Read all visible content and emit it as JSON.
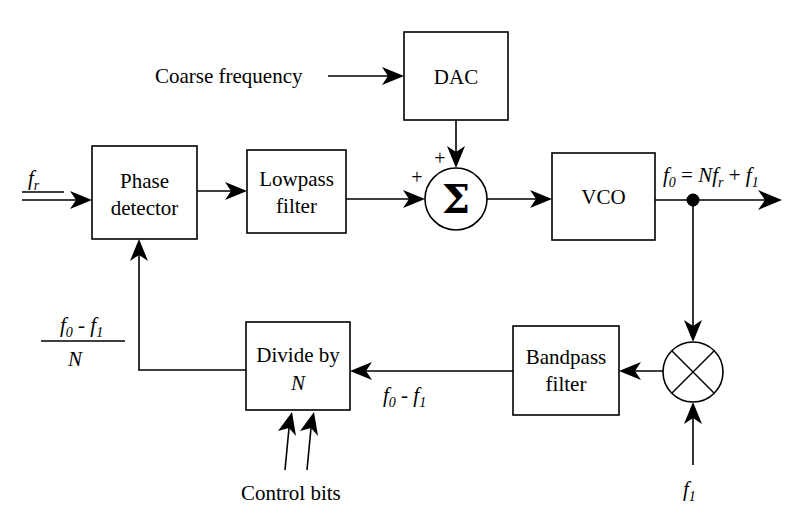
{
  "diagram": {
    "blocks": [
      {
        "id": "phase_detector",
        "line1": "Phase",
        "line2": "detector"
      },
      {
        "id": "lowpass_filter",
        "line1": "Lowpass",
        "line2": "filter"
      },
      {
        "id": "dac",
        "line1": "DAC",
        "line2": ""
      },
      {
        "id": "vco",
        "line1": "VCO",
        "line2": ""
      },
      {
        "id": "divide_by_n",
        "line1": "Divide by",
        "line2": "N"
      },
      {
        "id": "bandpass_filter",
        "line1": "Bandpass",
        "line2": "filter"
      }
    ],
    "operators": {
      "summing_junction": "Σ",
      "sum_input_plus_left": "+",
      "sum_input_plus_top": "+",
      "mixer": "multiplier"
    },
    "labels": {
      "coarse_frequency": "Coarse frequency",
      "reference_input_f": "f",
      "reference_input_sub": "r",
      "output_f": "f",
      "output_sub": "0",
      "output_eq": " = ",
      "output_N": "N",
      "output_fr": "f",
      "output_fr_sub": "r",
      "output_plus": " + ",
      "output_f1": "f",
      "output_f1_sub": "1",
      "mixer_input_f": "f",
      "mixer_input_sub": "1",
      "bandpass_out_f0": "f",
      "bandpass_out_f0_sub": "0",
      "bandpass_out_minus": " - ",
      "bandpass_out_f1": "f",
      "bandpass_out_f1_sub": "1",
      "fraction_num_f0": "f",
      "fraction_num_f0_sub": "0",
      "fraction_num_minus": " - ",
      "fraction_num_f1": "f",
      "fraction_num_f1_sub": "1",
      "fraction_den_N": "N",
      "control_bits": "Control bits"
    },
    "colors": {
      "stroke": "#000000",
      "background": "#ffffff"
    }
  }
}
